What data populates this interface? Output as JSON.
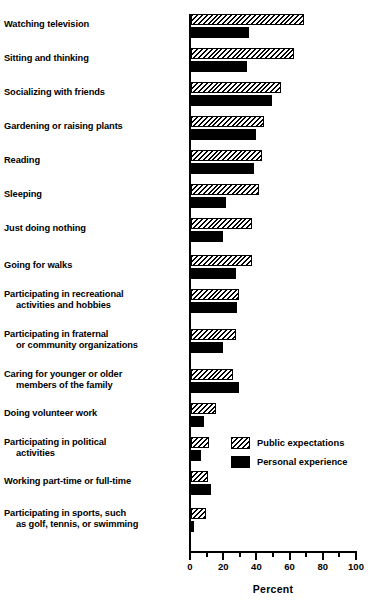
{
  "chart_data": {
    "type": "bar",
    "orientation": "horizontal",
    "title": "",
    "xlabel": "Percent",
    "ylabel": "",
    "xlim": [
      0,
      100
    ],
    "xticks": [
      0,
      20,
      40,
      60,
      80,
      100
    ],
    "xtick_labels": [
      "0",
      "20",
      "40",
      "60",
      "80",
      "100"
    ],
    "minor_ticks": [
      10,
      30,
      50,
      70,
      90
    ],
    "grid": false,
    "legend_position": "inside-lower-right",
    "categories": [
      "Watching television",
      "Sitting and thinking",
      "Socializing with friends",
      "Gardening or raising plants",
      "Reading",
      "Sleeping",
      "Just doing nothing",
      "Going for walks",
      "Participating in recreational\nactivities and hobbies",
      "Participating in fraternal\nor community organizations",
      "Caring for younger or older\nmembers of the family",
      "Doing volunteer work",
      "Participating in political\nactivities",
      "Working part-time or full-time",
      "Participating in sports, such\nas golf, tennis, or swimming"
    ],
    "series": [
      {
        "name": "Public expectations",
        "pattern": "diagonal-hatch",
        "color": "#000000",
        "values": [
          68,
          62,
          54,
          44,
          43,
          41,
          37,
          37,
          29,
          27,
          25,
          15,
          11,
          10,
          9
        ]
      },
      {
        "name": "Personal experience",
        "pattern": "solid",
        "color": "#000000",
        "values": [
          35,
          34,
          49,
          39,
          38,
          21,
          19,
          27,
          28,
          19,
          29,
          8,
          6,
          12,
          2
        ]
      }
    ]
  },
  "legend": {
    "items": [
      {
        "label": "Public expectations"
      },
      {
        "label": "Personal experience"
      }
    ]
  },
  "axis": {
    "title": "Percent"
  }
}
